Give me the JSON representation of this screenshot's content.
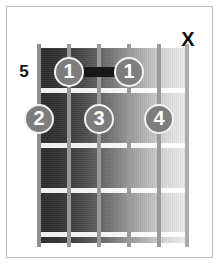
{
  "diagram": {
    "type": "guitar-chord-diagram",
    "fret_position_label": "5",
    "num_strings": 6,
    "num_fret_spaces": 5,
    "colors": {
      "background": "#ffffff",
      "frame_border": "#b9b9b9",
      "board_dark": "#2a2a2a",
      "board_light": "#f0f0f0",
      "fret_line": "#ffffff",
      "string": "#9a9a9a",
      "dot_fill": "#7d7d7d",
      "dot_ring": "#f2f2f2",
      "dot_text": "#ffffff",
      "barre": "#181818",
      "label_text": "#111111"
    },
    "string_markers": [
      {
        "name": "mute-marker",
        "string": 1,
        "symbol": "X",
        "meaning": "muted"
      }
    ],
    "barre": {
      "present": true,
      "finger": "1",
      "fret_row": 1,
      "from_string": 5,
      "to_string": 3
    },
    "fingerings": [
      {
        "finger": "1",
        "string": 5,
        "fret_row": 1
      },
      {
        "finger": "1",
        "string": 3,
        "fret_row": 1
      },
      {
        "finger": "2",
        "string": 6,
        "fret_row": 2
      },
      {
        "finger": "3",
        "string": 4,
        "fret_row": 2
      },
      {
        "finger": "4",
        "string": 2,
        "fret_row": 2
      }
    ],
    "fret_lines": [
      {
        "index": 1,
        "y": 40
      },
      {
        "index": 2,
        "y": 95
      },
      {
        "index": 3,
        "y": 140
      },
      {
        "index": 4,
        "y": 184
      }
    ],
    "strings": [
      {
        "index": 6,
        "x": 0
      },
      {
        "index": 5,
        "x": 30
      },
      {
        "index": 4,
        "x": 60
      },
      {
        "index": 3,
        "x": 90
      },
      {
        "index": 2,
        "x": 120
      },
      {
        "index": 1,
        "x": 148
      }
    ]
  }
}
